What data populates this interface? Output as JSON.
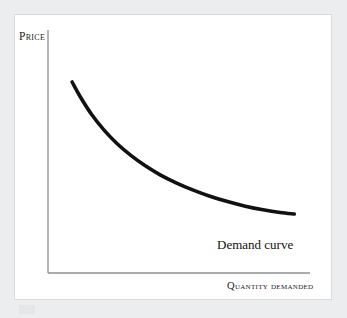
{
  "figure": {
    "background_color": "#ecedee",
    "panel_color": "#ffffff",
    "panel_border_color": "#d9dadb"
  },
  "axes": {
    "y_label": "Price",
    "x_label": "Quantity demanded",
    "axis_color": "#8d8f91",
    "origin_x": 48,
    "origin_y": 273,
    "y_top": 30,
    "x_right": 310
  },
  "annotation": {
    "demand_curve_label": "Demand curve",
    "label_color": "#111111"
  },
  "chart_data": {
    "type": "line",
    "title": "",
    "subtitle": "",
    "xlabel": "Quantity demanded",
    "ylabel": "Price",
    "grid": false,
    "legend_position": "inline-annotation",
    "xlim": [
      0,
      100
    ],
    "ylim": [
      0,
      100
    ],
    "axis_ticks": {
      "x": [],
      "y": []
    },
    "series": [
      {
        "name": "Demand curve",
        "color": "#111111",
        "line_width": 3.6,
        "x": [
          9.2,
          12.6,
          16.8,
          21.4,
          26.3,
          31.5,
          37.0,
          42.8,
          48.9,
          55.2,
          61.8,
          68.5,
          75.3,
          82.1,
          88.6,
          94.0
        ],
        "y": [
          78.6,
          72.0,
          65.0,
          58.8,
          53.3,
          48.5,
          44.2,
          40.4,
          37.1,
          34.2,
          31.6,
          29.4,
          27.5,
          26.0,
          24.9,
          24.3
        ]
      }
    ],
    "annotations": [
      {
        "text": "Demand curve",
        "x": 78.5,
        "y": 17.0
      }
    ]
  }
}
